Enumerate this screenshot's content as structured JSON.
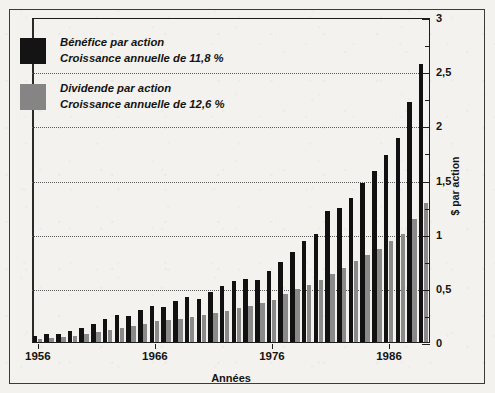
{
  "chart_data": {
    "type": "bar",
    "title": "",
    "subtitle": "",
    "xlabel": "Années",
    "ylabel": "$ par action",
    "ylim": [
      0,
      3
    ],
    "y_ticks": [
      "0",
      "0,5",
      "1",
      "1,5",
      "2",
      "2,5",
      "3"
    ],
    "y_tick_values": [
      0,
      0.5,
      1,
      1.5,
      2,
      2.5,
      3
    ],
    "y_minor_step": 0.25,
    "grid": "horizontal-dotted",
    "legend_position": "top-left",
    "x_tick_labels": [
      "1956",
      "1966",
      "1976",
      "1986"
    ],
    "x_tick_values": [
      1956,
      1966,
      1976,
      1986
    ],
    "x_range": [
      1956,
      1989
    ],
    "categories": [
      1956,
      1957,
      1958,
      1959,
      1960,
      1961,
      1962,
      1963,
      1964,
      1965,
      1966,
      1967,
      1968,
      1969,
      1970,
      1971,
      1972,
      1973,
      1974,
      1975,
      1976,
      1977,
      1978,
      1979,
      1980,
      1981,
      1982,
      1983,
      1984,
      1985,
      1986,
      1987,
      1988,
      1989
    ],
    "series": [
      {
        "name": "Bénéfice par action",
        "color": "#111111",
        "growth_label": "Croissance annuelle de 11,8 %",
        "values": [
          0.06,
          0.07,
          0.07,
          0.1,
          0.13,
          0.17,
          0.21,
          0.25,
          0.24,
          0.3,
          0.33,
          0.32,
          0.38,
          0.42,
          0.4,
          0.46,
          0.52,
          0.56,
          0.58,
          0.57,
          0.66,
          0.74,
          0.83,
          0.93,
          1.0,
          1.21,
          1.24,
          1.33,
          1.47,
          1.58,
          1.73,
          1.88,
          2.22,
          2.57
        ]
      },
      {
        "name": "Dividende par action",
        "color": "#8a8a8a",
        "growth_label": "Croissance annuelle de 12,6 %",
        "values": [
          0.03,
          0.04,
          0.05,
          0.06,
          0.07,
          0.09,
          0.11,
          0.13,
          0.15,
          0.17,
          0.19,
          0.2,
          0.21,
          0.23,
          0.25,
          0.27,
          0.29,
          0.31,
          0.33,
          0.36,
          0.39,
          0.44,
          0.49,
          0.53,
          0.57,
          0.63,
          0.68,
          0.75,
          0.8,
          0.86,
          0.93,
          1.0,
          1.14,
          1.28
        ]
      }
    ],
    "annotations": []
  },
  "legend": {
    "items": [
      {
        "swatch": "earn",
        "line1": "Bénéfice par action",
        "line2": "Croissance annuelle de 11,8 %"
      },
      {
        "swatch": "div",
        "line1": "Dividende par action",
        "line2": "Croissance annuelle de 12,6 %"
      }
    ]
  }
}
